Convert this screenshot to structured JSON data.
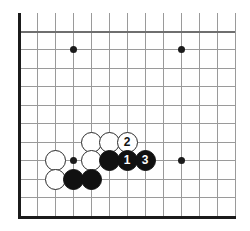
{
  "figure": {
    "kind": "go-board-diagram",
    "board_background": "#ffffff",
    "line_color": "#9a9a9a",
    "edge_color": "#1b1b1b",
    "black_stone_color": "#111111",
    "white_stone_color": "#ffffff",
    "move_label_black_color": "#ffffff",
    "move_label_white_color": "#111111"
  },
  "geometry": {
    "width": 250,
    "height": 231,
    "column_x": [
      19,
      37,
      55,
      73,
      91,
      109,
      127,
      145,
      163,
      181,
      199,
      217,
      235
    ],
    "row_y": [
      31,
      49,
      68,
      86,
      105,
      123,
      142,
      160,
      179,
      197,
      216
    ],
    "grid_spacing": 18,
    "stone_diameter": 21,
    "left_edge_x": 19,
    "top_edge_y": 31,
    "bottom_edge_y": 216,
    "vertical_line_top_overhang_y": 13
  },
  "star_points": [
    {
      "name": "star-point-upper-left",
      "col": 3,
      "row": 1
    },
    {
      "name": "star-point-upper-right",
      "col": 9,
      "row": 1
    },
    {
      "name": "star-point-right",
      "col": 9,
      "row": 7
    },
    {
      "name": "star-point-left",
      "col": 3,
      "row": 7
    }
  ],
  "stones": [
    {
      "id": "white-a",
      "color": "white",
      "col": 4,
      "row": 6,
      "label": ""
    },
    {
      "id": "white-b",
      "color": "white",
      "col": 5,
      "row": 6,
      "label": ""
    },
    {
      "id": "white-move-2",
      "color": "white",
      "col": 6,
      "row": 6,
      "label": "2"
    },
    {
      "id": "white-c",
      "color": "white",
      "col": 2,
      "row": 7,
      "label": ""
    },
    {
      "id": "white-d",
      "color": "white",
      "col": 4,
      "row": 7,
      "label": ""
    },
    {
      "id": "black-a",
      "color": "black",
      "col": 5,
      "row": 7,
      "label": ""
    },
    {
      "id": "black-move-1",
      "color": "black",
      "col": 6,
      "row": 7,
      "label": "1"
    },
    {
      "id": "black-move-3",
      "color": "black",
      "col": 7,
      "row": 7,
      "label": "3"
    },
    {
      "id": "white-e",
      "color": "white",
      "col": 2,
      "row": 8,
      "label": ""
    },
    {
      "id": "black-b",
      "color": "black",
      "col": 3,
      "row": 8,
      "label": ""
    },
    {
      "id": "black-c",
      "color": "black",
      "col": 4,
      "row": 8,
      "label": ""
    }
  ],
  "move_sequence": [
    {
      "number": "1",
      "color": "black"
    },
    {
      "number": "2",
      "color": "white"
    },
    {
      "number": "3",
      "color": "black"
    }
  ]
}
